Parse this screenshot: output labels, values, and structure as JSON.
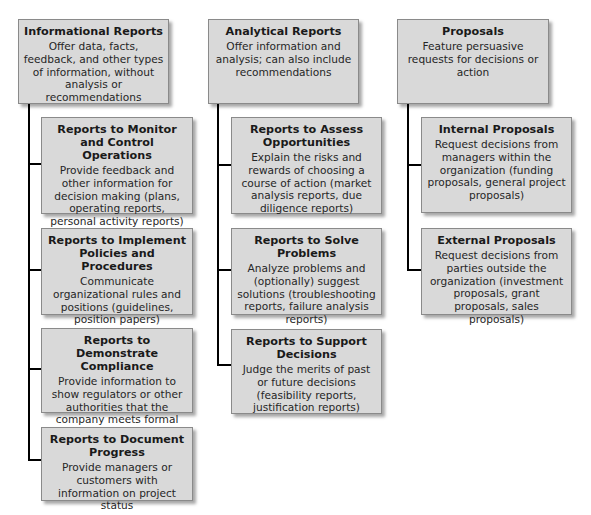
{
  "diagram": {
    "type": "hierarchy",
    "columns": [
      {
        "id": "informational",
        "title": "Informational Reports",
        "description": "Offer data, facts, feedback, and other types of information, without analysis or recommendations",
        "children": [
          {
            "title": "Reports to Monitor and Control Operations",
            "description": "Provide feedback and other information for decision making (plans, operating reports, personal activity reports)"
          },
          {
            "title": "Reports to Implement Policies and Procedures",
            "description": "Communicate organizational rules and positions (guidelines, position papers)"
          },
          {
            "title": "Reports to Demonstrate Compliance",
            "description": "Provide information to show regulators or other authorities that the company meets formal requirements"
          },
          {
            "title": "Reports to Document Progress",
            "description": "Provide managers or customers with information on project status"
          }
        ]
      },
      {
        "id": "analytical",
        "title": "Analytical Reports",
        "description": "Offer information and analysis; can also include recommendations",
        "children": [
          {
            "title": "Reports to Assess Opportunities",
            "description": "Explain the risks and rewards of choosing a course of action (market analysis reports, due diligence reports)"
          },
          {
            "title": "Reports to Solve Problems",
            "description": "Analyze problems and (optionally) suggest solutions (troubleshooting reports, failure analysis reports)"
          },
          {
            "title": "Reports to Support Decisions",
            "description": "Judge the merits of past or future decisions (feasibility reports, justification reports)"
          }
        ]
      },
      {
        "id": "proposals",
        "title": "Proposals",
        "description": "Feature persuasive requests for decisions or action",
        "children": [
          {
            "title": "Internal Proposals",
            "description": "Request decisions from managers within the organization (funding proposals, general project proposals)"
          },
          {
            "title": "External Proposals",
            "description": "Request decisions from parties outside the organization (investment proposals, grant proposals, sales proposals)"
          }
        ]
      }
    ]
  },
  "colors": {
    "box_fill": "#d9d9d9",
    "box_border": "#8a8a8a",
    "connector": "#000000",
    "background": "#ffffff"
  }
}
